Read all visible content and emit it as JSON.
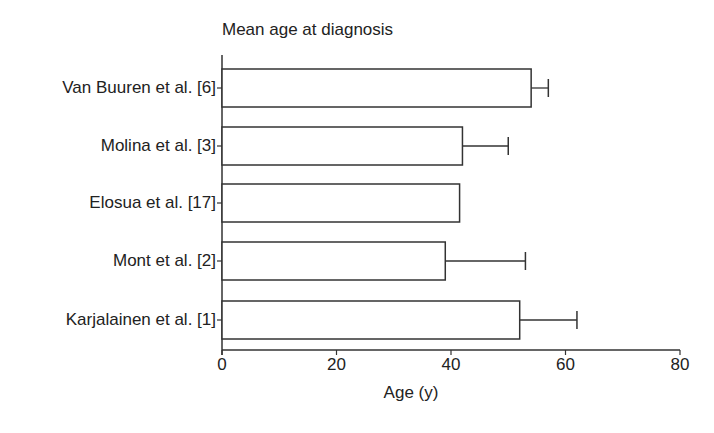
{
  "chart_data": {
    "type": "bar",
    "orientation": "horizontal",
    "title": "Mean age at diagnosis",
    "xlabel": "Age (y)",
    "ylabel": "",
    "xlim": [
      0,
      80
    ],
    "xticks": [
      0,
      20,
      40,
      60,
      80
    ],
    "categories": [
      "Van Buuren et al. [6]",
      "Molina et al. [3]",
      "Elosua et al. [17]",
      "Mont et al. [2]",
      "Karjalainen et al. [1]"
    ],
    "values": [
      54,
      42,
      41.5,
      39,
      52
    ],
    "error_upper": [
      57,
      50,
      null,
      53,
      62
    ],
    "grid": false,
    "legend": null,
    "bar_fill": "#ffffff",
    "bar_stroke": "#333333"
  }
}
